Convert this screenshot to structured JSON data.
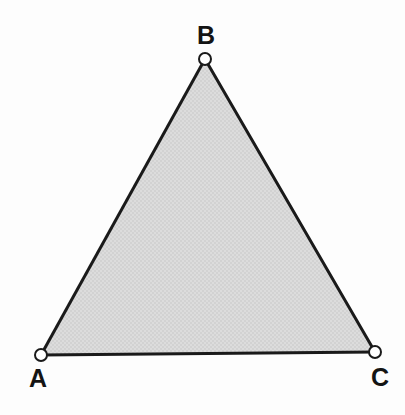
{
  "figure": {
    "type": "geometric-diagram",
    "shape": "triangle",
    "canvas": {
      "width": 405,
      "height": 415
    },
    "colors": {
      "background": "#fdfdfd",
      "fill": "#d8d8d8",
      "stroke": "#1a1a1a",
      "vertex_fill": "#ffffff",
      "vertex_stroke": "#1a1a1a",
      "label": "#141414"
    },
    "style": {
      "edge_stroke_width": 3,
      "vertex_radius": 6,
      "vertex_stroke_width": 2
    },
    "vertices": [
      {
        "id": "A",
        "label": "A",
        "x": 41,
        "y": 355,
        "label_x": 38,
        "label_y": 379
      },
      {
        "id": "B",
        "label": "B",
        "x": 205,
        "y": 59,
        "label_x": 206,
        "label_y": 36
      },
      {
        "id": "C",
        "label": "C",
        "x": 375,
        "y": 352,
        "label_x": 380,
        "label_y": 378
      }
    ],
    "edges": [
      {
        "id": "AB",
        "from": "A",
        "to": "B"
      },
      {
        "id": "BC",
        "from": "B",
        "to": "C"
      },
      {
        "id": "CA",
        "from": "C",
        "to": "A"
      }
    ]
  }
}
